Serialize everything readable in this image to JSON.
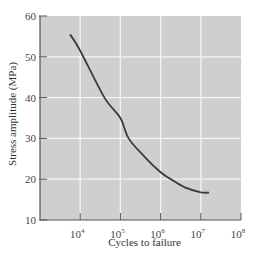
{
  "chart_data": {
    "type": "line",
    "title": "",
    "xlabel": "Cycles to failure",
    "ylabel": "Stress amplitude (MPa)",
    "xscale": "log",
    "xlim": [
      1000,
      100000000
    ],
    "ylim": [
      10,
      60
    ],
    "grid": true,
    "legend": null,
    "x_ticks": [
      {
        "value": 10000,
        "label": "10",
        "exp": "4"
      },
      {
        "value": 100000,
        "label": "10",
        "exp": "5"
      },
      {
        "value": 1000000,
        "label": "10",
        "exp": "6"
      },
      {
        "value": 10000000,
        "label": "10",
        "exp": "7"
      },
      {
        "value": 100000000,
        "label": "10",
        "exp": "8"
      }
    ],
    "y_ticks": [
      10,
      20,
      30,
      40,
      50,
      60
    ],
    "series": [
      {
        "name": "S-N curve",
        "color": "#3a3a3a",
        "points": [
          {
            "N": 5600,
            "S": 55.5
          },
          {
            "N": 10000,
            "S": 51.5
          },
          {
            "N": 40000,
            "S": 40.0
          },
          {
            "N": 100000,
            "S": 35.0
          },
          {
            "N": 160000,
            "S": 30.0
          },
          {
            "N": 400000,
            "S": 25.5
          },
          {
            "N": 1000000,
            "S": 21.7
          },
          {
            "N": 1800000,
            "S": 20.0
          },
          {
            "N": 4000000,
            "S": 18.0
          },
          {
            "N": 10000000,
            "S": 16.8
          },
          {
            "N": 16000000,
            "S": 16.7
          }
        ]
      }
    ]
  },
  "colors": {
    "plot_bg": "#cfcfcf",
    "grid": "#f4f4f4",
    "axis": "#555555",
    "curve": "#3a3a3a"
  }
}
